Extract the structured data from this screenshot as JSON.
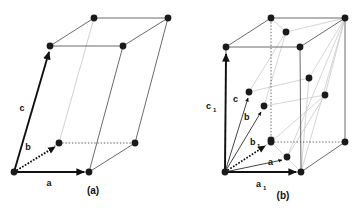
{
  "figure": {
    "type": "crystal-lattice-diagram",
    "background_color": "#ffffff",
    "panels": [
      {
        "id": "a",
        "caption": "(a)",
        "caption_pos": [
          93,
          194
        ],
        "description": "Monoclinic / triclinic base-centered unit cell with lattice points at corners and on the two end faces",
        "vector_labels": [
          {
            "name": "a",
            "text": "a",
            "sub": "",
            "pos": [
              49,
              186
            ]
          },
          {
            "name": "b",
            "text": "b",
            "sub": "",
            "pos": [
              28,
              150
            ]
          },
          {
            "name": "c",
            "text": "c",
            "sub": "",
            "pos": [
              22,
              111
            ]
          }
        ],
        "lattice_points": [
          [
            14,
            172
          ],
          [
            89,
            172
          ],
          [
            59,
            143
          ],
          [
            135,
            143
          ],
          [
            50,
            46
          ],
          [
            123,
            46
          ],
          [
            94,
            18
          ],
          [
            168,
            18
          ]
        ],
        "solid_edges": [
          [
            [
              14,
              172
            ],
            [
              89,
              172
            ]
          ],
          [
            [
              14,
              172
            ],
            [
              50,
              46
            ]
          ],
          [
            [
              50,
              46
            ],
            [
              94,
              18
            ]
          ],
          [
            [
              94,
              18
            ],
            [
              168,
              18
            ]
          ],
          [
            [
              50,
              46
            ],
            [
              123,
              46
            ]
          ],
          [
            [
              123,
              46
            ],
            [
              168,
              18
            ]
          ],
          [
            [
              89,
              172
            ],
            [
              135,
              143
            ]
          ],
          [
            [
              123,
              46
            ],
            [
              89,
              172
            ]
          ],
          [
            [
              168,
              18
            ],
            [
              135,
              143
            ]
          ],
          [
            [
              59,
              143
            ],
            [
              135,
              143
            ]
          ],
          [
            [
              14,
              172
            ],
            [
              59,
              143
            ]
          ]
        ],
        "dotted_edges": [
          [
            [
              59,
              143
            ],
            [
              135,
              143
            ]
          ],
          [
            [
              14,
              172
            ],
            [
              59,
              143
            ]
          ]
        ],
        "faint_edges": [
          [
            [
              94,
              18
            ],
            [
              59,
              143
            ]
          ]
        ],
        "vectors": [
          {
            "name": "a-vector",
            "from": [
              14,
              172
            ],
            "to": [
              86,
              172
            ],
            "style": "solid-bold"
          },
          {
            "name": "b-vector",
            "from": [
              14,
              172
            ],
            "to": [
              57,
              145
            ],
            "style": "dotted-bold"
          },
          {
            "name": "c-vector",
            "from": [
              14,
              172
            ],
            "to": [
              49,
              49
            ],
            "style": "solid-bold"
          }
        ]
      },
      {
        "id": "b",
        "caption": "(b)",
        "caption_pos": [
          283,
          199
        ],
        "description": "Corresponding larger face-centered cell showing primitive vectors a, b, c inside the cell defined by a1, c1",
        "vector_labels": [
          {
            "name": "a1",
            "text": "a",
            "sub": "1",
            "pos": [
              259,
              187
            ]
          },
          {
            "name": "b1",
            "text": "b",
            "sub": "1",
            "pos": [
              253,
              145
            ]
          },
          {
            "name": "c1",
            "text": "c",
            "sub": "1",
            "pos": [
              209,
              109
            ]
          },
          {
            "name": "a",
            "text": "a",
            "sub": "",
            "pos": [
              271,
              165
            ]
          },
          {
            "name": "b",
            "text": "b",
            "sub": "",
            "pos": [
              247,
              119
            ]
          },
          {
            "name": "c",
            "text": "c",
            "sub": "",
            "pos": [
              237,
              101
            ]
          }
        ],
        "lattice_points": [
          [
            225,
            172
          ],
          [
            301,
            172
          ],
          [
            271,
            142
          ],
          [
            345,
            142
          ],
          [
            226,
            47
          ],
          [
            300,
            47
          ],
          [
            271,
            18
          ],
          [
            345,
            18
          ],
          [
            286,
            32
          ],
          [
            309,
            78
          ],
          [
            325,
            95
          ],
          [
            249,
            92
          ],
          [
            264,
            106
          ],
          [
            271,
            140
          ],
          [
            287,
            157
          ]
        ],
        "solid_edges": [
          [
            [
              225,
              172
            ],
            [
              301,
              172
            ]
          ],
          [
            [
              225,
              172
            ],
            [
              226,
              47
            ]
          ],
          [
            [
              226,
              47
            ],
            [
              300,
              47
            ]
          ],
          [
            [
              226,
              47
            ],
            [
              271,
              18
            ]
          ],
          [
            [
              271,
              18
            ],
            [
              345,
              18
            ]
          ],
          [
            [
              300,
              47
            ],
            [
              345,
              18
            ]
          ],
          [
            [
              300,
              47
            ],
            [
              301,
              172
            ]
          ],
          [
            [
              345,
              18
            ],
            [
              345,
              142
            ]
          ],
          [
            [
              301,
              172
            ],
            [
              345,
              142
            ]
          ]
        ],
        "dotted_edges": [
          [
            [
              225,
              172
            ],
            [
              271,
              142
            ]
          ],
          [
            [
              271,
              142
            ],
            [
              345,
              142
            ]
          ],
          [
            [
              271,
              142
            ],
            [
              271,
              18
            ]
          ]
        ],
        "vectors": [
          {
            "name": "a1-vector",
            "from": [
              225,
              172
            ],
            "to": [
              298,
              172
            ],
            "style": "solid-bold"
          },
          {
            "name": "c1-vector",
            "from": [
              225,
              172
            ],
            "to": [
              226,
              50
            ],
            "style": "solid-bold"
          },
          {
            "name": "b1-vector",
            "from": [
              225,
              172
            ],
            "to": [
              268,
              143
            ],
            "style": "dotted-bold"
          },
          {
            "name": "a-vector",
            "from": [
              225,
              172
            ],
            "to": [
              284,
              159
            ],
            "style": "solid-thin"
          },
          {
            "name": "b-vector",
            "from": [
              225,
              172
            ],
            "to": [
              262,
              109
            ],
            "style": "solid-thin"
          },
          {
            "name": "c-vector",
            "from": [
              225,
              172
            ],
            "to": [
              248,
              95
            ],
            "style": "solid-thin"
          }
        ]
      }
    ],
    "colors": {
      "point_fill": "#1a1a1a",
      "edge_solid": "#555555",
      "edge_faint": "#c8c8c8",
      "vector_bold": "#111111",
      "text": "#111111"
    }
  }
}
